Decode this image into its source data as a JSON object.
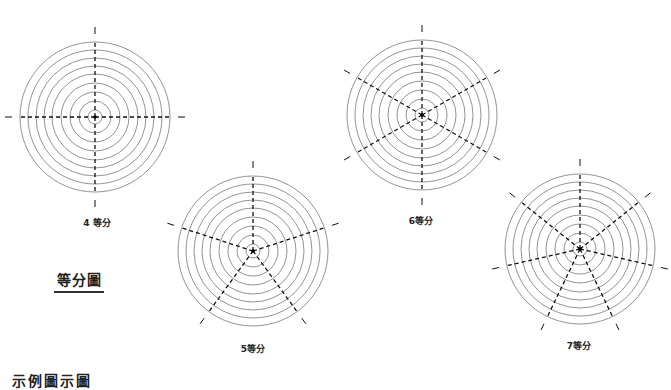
{
  "title": "等分圖",
  "bottom_cutoff_text": "示例圖示圖",
  "style": {
    "ring_color": "#777777",
    "spoke_color": "#111111",
    "background": "#ffffff"
  },
  "diagrams": [
    {
      "label": "4 等分",
      "divisions": 4,
      "cx": 95,
      "cy": 117,
      "start_angle_deg": 0,
      "label_x": 97,
      "label_y": 216
    },
    {
      "label": "5等分",
      "divisions": 5,
      "cx": 253,
      "cy": 251,
      "start_angle_deg": 0,
      "label_x": 253,
      "label_y": 342
    },
    {
      "label": "6等分",
      "divisions": 6,
      "cx": 422,
      "cy": 115,
      "start_angle_deg": 0,
      "label_x": 421,
      "label_y": 214
    },
    {
      "label": "7等分",
      "divisions": 7,
      "cx": 580,
      "cy": 249,
      "start_angle_deg": 0,
      "label_x": 579,
      "label_y": 339
    }
  ],
  "ring_radii": [
    7,
    16,
    25,
    34,
    43,
    51,
    59,
    67,
    75
  ],
  "spoke_radius": 75,
  "tick_inner_radius": 83,
  "tick_outer_radius": 90
}
